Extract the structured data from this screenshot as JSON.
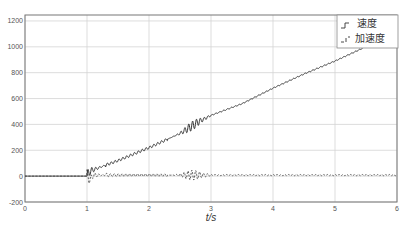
{
  "chart_data": {
    "type": "line",
    "title": "",
    "xlabel": "t/s",
    "ylabel": "",
    "xlim": [
      0,
      6
    ],
    "ylim": [
      -200,
      1250
    ],
    "x_ticks": [
      "0",
      "1",
      "2",
      "3",
      "4",
      "5",
      "6"
    ],
    "y_ticks": [
      "-200",
      "0",
      "200",
      "400",
      "600",
      "800",
      "1000",
      "1200"
    ],
    "grid": true,
    "legend_position": "upper right",
    "series": [
      {
        "name": "速度",
        "style": "solid",
        "x": [
          0,
          1.0,
          1.05,
          1.5,
          2.0,
          2.5,
          2.8,
          3.0,
          3.5,
          4.0,
          4.5,
          5.0,
          5.45,
          6.0
        ],
        "values": [
          0,
          0,
          40,
          120,
          220,
          330,
          420,
          470,
          560,
          680,
          790,
          890,
          990,
          1100
        ],
        "note": "oscillation amplitude ~40 near t=1.0-1.2, ~40 near t=2.5-2.9, small ripple elsewhere"
      },
      {
        "name": "加速度",
        "style": "dashed",
        "x": [
          0,
          1.0,
          1.1,
          1.5,
          2.0,
          2.5,
          2.8,
          3.0,
          4.0,
          5.0,
          6.0
        ],
        "values": [
          0,
          0,
          -40,
          0,
          0,
          20,
          30,
          10,
          5,
          5,
          5
        ],
        "note": "oscillates around ~10 with amplitude ~50 at t≈1.05, ~40 at t≈2.7, tiny ripple after t=3"
      }
    ]
  }
}
